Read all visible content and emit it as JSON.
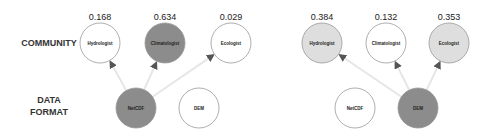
{
  "row_labels": {
    "community": "COMMUNITY",
    "data_format_line1": "DATA",
    "data_format_line2": "FORMAT"
  },
  "colors": {
    "dark": "#8c8c8c",
    "light": "#dedede",
    "white": "#ffffff",
    "stroke": "#999999",
    "edge": "#e6e6e6"
  },
  "panels": [
    {
      "community": [
        {
          "label": "Hydrologist",
          "value": "0.168",
          "cx": 100,
          "fill": "white"
        },
        {
          "label": "Climatologist",
          "value": "0.634",
          "cx": 165,
          "fill": "dark"
        },
        {
          "label": "Ecologist",
          "value": "0.029",
          "cx": 231,
          "fill": "white"
        }
      ],
      "formats": [
        {
          "label": "NetCDF",
          "cx": 136,
          "fill": "dark",
          "selected": true
        },
        {
          "label": "DEM",
          "cx": 199,
          "fill": "white",
          "selected": false
        }
      ]
    },
    {
      "community": [
        {
          "label": "Hydrologist",
          "value": "0.384",
          "cx": 322,
          "fill": "light"
        },
        {
          "label": "Climatologist",
          "value": "0.132",
          "cx": 386,
          "fill": "white"
        },
        {
          "label": "Ecologist",
          "value": "0.353",
          "cx": 449,
          "fill": "light"
        }
      ],
      "formats": [
        {
          "label": "NetCDF",
          "cx": 355,
          "fill": "white",
          "selected": false
        },
        {
          "label": "DEM",
          "cx": 418,
          "fill": "dark",
          "selected": true
        }
      ]
    }
  ]
}
